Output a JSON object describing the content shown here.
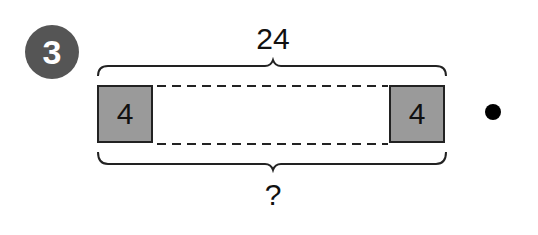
{
  "problem": {
    "number": "3",
    "total_label": "24",
    "left_box_value": "4",
    "right_box_value": "4",
    "unknown_label": "?",
    "bullet": "•"
  },
  "colors": {
    "badge": "#555555",
    "box_fill": "#9a9a9a",
    "stroke": "#222222"
  }
}
